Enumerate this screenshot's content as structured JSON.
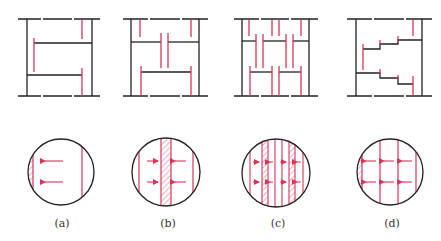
{
  "colors": {
    "structure": "#222222",
    "flow": "#d9345a",
    "hatch": "#d9345a",
    "background": "#ffffff"
  },
  "panels": [
    {
      "id": "a",
      "label": "(a)",
      "description": "single-pass tray: liquid flows across one tray"
    },
    {
      "id": "b",
      "label": "(b)",
      "description": "double-pass tray: center downcomer"
    },
    {
      "id": "c",
      "label": "(c)",
      "description": "four-pass tray: multiple downcomers"
    },
    {
      "id": "d",
      "label": "(d)",
      "description": "stepped (cascade) tray"
    }
  ]
}
